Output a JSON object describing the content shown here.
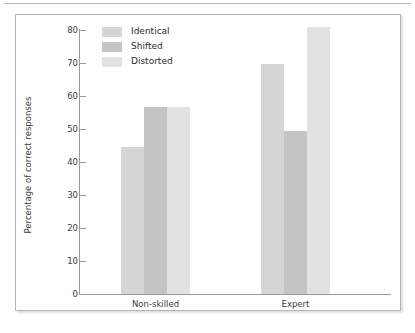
{
  "chart_data": {
    "type": "bar",
    "title": "",
    "subtitle": "",
    "xlabel": "",
    "ylabel": "Percentage of correct responses",
    "categories": [
      "Non-skilled",
      "Expert"
    ],
    "series": [
      {
        "name": "Identical",
        "values": [
          44.5,
          69.8
        ],
        "color": "#d5d5d5"
      },
      {
        "name": "Shifted",
        "values": [
          56.8,
          49.4
        ],
        "color": "#c4c4c4"
      },
      {
        "name": "Distorted",
        "values": [
          56.8,
          81.0
        ],
        "color": "#e2e2e2"
      }
    ],
    "ylim": [
      0,
      80
    ],
    "yticks": [
      0,
      10,
      20,
      30,
      40,
      50,
      60,
      70,
      80
    ],
    "ytick_labels": [
      "0",
      "10",
      "20",
      "30",
      "40",
      "50",
      "60",
      "70",
      "80"
    ],
    "grid": false,
    "legend_position": "upper-left-inside",
    "bar_gap_within_group": 0,
    "frame": true
  },
  "legend": {
    "entries": [
      {
        "label": "Identical",
        "color": "#d5d5d5"
      },
      {
        "label": "Shifted",
        "color": "#c4c4c4"
      },
      {
        "label": "Distorted",
        "color": "#e2e2e2"
      }
    ]
  },
  "axis": {
    "y_title": "Percentage of correct responses",
    "y_labels": [
      "80",
      "70",
      "60",
      "50",
      "40",
      "30",
      "20",
      "10",
      "0"
    ],
    "x_labels": [
      "Non-skilled",
      "Expert"
    ]
  },
  "colors": {
    "frame_border": "#b4b4b4",
    "axis_line": "#9a9a9a",
    "text": "#3b3b3b",
    "background": "#ffffff",
    "top_rule": "#b9b9b9"
  }
}
